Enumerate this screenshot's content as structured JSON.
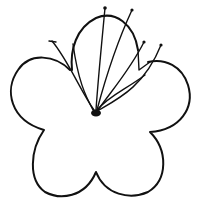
{
  "drawing": {
    "subject": "flower line drawing",
    "ink_color": "#111111",
    "background_color": "#ffffff",
    "petal_count": 5,
    "stamen_count": 5
  }
}
